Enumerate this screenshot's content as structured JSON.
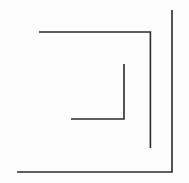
{
  "figure": {
    "kind": "line-drawing",
    "canvas": {
      "width": 189,
      "height": 183,
      "background_color": "#fdfdfd"
    },
    "stroke": {
      "color": "#2b2b2b",
      "width": 1.6,
      "linecap": "butt",
      "linejoin": "miter"
    },
    "paths": [
      {
        "name": "outer-spiral-arm",
        "d": "M 17 172 L 172 172 L 172 10",
        "points": [
          [
            17,
            172
          ],
          [
            172,
            172
          ],
          [
            172,
            10
          ]
        ]
      },
      {
        "name": "middle-spiral-arm",
        "d": "M 39 32 L 150.4 32 L 150.4 148",
        "points": [
          [
            39,
            32
          ],
          [
            150,
            32
          ],
          [
            150,
            148
          ]
        ]
      },
      {
        "name": "inner-spiral-arm",
        "d": "M 71 119 L 124 119 L 124 64",
        "points": [
          [
            71,
            119
          ],
          [
            124,
            119
          ],
          [
            124,
            64
          ]
        ]
      }
    ]
  }
}
